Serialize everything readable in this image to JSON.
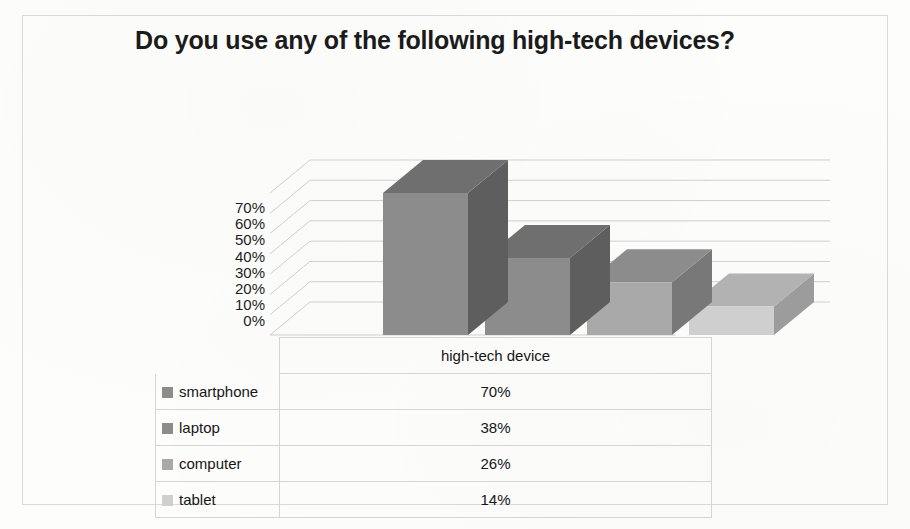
{
  "chart_data": {
    "type": "bar",
    "title": "Do you use any of the following high-tech devices?",
    "subtitle": "",
    "xlabel": "",
    "ylabel": "",
    "categories": [
      "smartphone",
      "laptop",
      "computer",
      "tablet"
    ],
    "values": [
      70,
      38,
      26,
      14
    ],
    "value_labels": [
      "70%",
      "38%",
      "26%",
      "14%"
    ],
    "series": [
      {
        "name": "high-tech device",
        "values": [
          70,
          38,
          26,
          14
        ]
      }
    ],
    "ylim": [
      0,
      70
    ],
    "ytick_labels": [
      "70%",
      "60%",
      "50%",
      "40%",
      "30%",
      "20%",
      "10%",
      "0%"
    ],
    "ytick_values": [
      70,
      60,
      50,
      40,
      30,
      20,
      10,
      0
    ],
    "grid": true,
    "legend_position": "data-table-left",
    "style": "3d-column",
    "colors": {
      "bar_front": [
        "#8c8c8c",
        "#8c8c8c",
        "#a9a9a9",
        "#cfcfcf"
      ],
      "bar_top": [
        "#6f6f6f",
        "#6f6f6f",
        "#8c8c8c",
        "#b2b2b2"
      ],
      "bar_side": [
        "#5e5e5e",
        "#5e5e5e",
        "#787878",
        "#9c9c9c"
      ],
      "gridline": "#cfcfcd",
      "table_border": "#d5d5d3",
      "text": "#161616",
      "background": "#fdfdfc"
    }
  },
  "table": {
    "series_header": "high-tech device",
    "rows": [
      {
        "category": "smartphone",
        "value": "70%",
        "swatch": "#8c8c8c"
      },
      {
        "category": "laptop",
        "value": "38%",
        "swatch": "#8c8c8c"
      },
      {
        "category": "computer",
        "value": "26%",
        "swatch": "#a9a9a9"
      },
      {
        "category": "tablet",
        "value": "14%",
        "swatch": "#cfcfcf"
      }
    ]
  },
  "axis": {
    "ticks": [
      "70%",
      "60%",
      "50%",
      "40%",
      "30%",
      "20%",
      "10%",
      "0%"
    ]
  }
}
